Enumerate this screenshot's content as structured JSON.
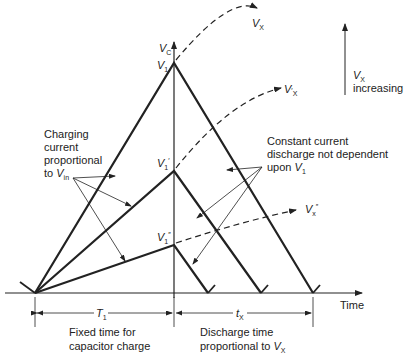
{
  "diagram": {
    "axes": {
      "y_label": "V",
      "y_label_sub": "C",
      "x_label": "Time"
    },
    "peaks": [
      {
        "label": "V",
        "sub": "1",
        "prime": ""
      },
      {
        "label": "V",
        "sub": "1",
        "prime": "′"
      },
      {
        "label": "V",
        "sub": "1",
        "prime": "″"
      }
    ],
    "curves": [
      {
        "label": "V",
        "sub": "X",
        "prime": ""
      },
      {
        "label": "V",
        "sub": "X",
        "prime": "′"
      },
      {
        "label": "V",
        "sub": "x",
        "prime": "″"
      }
    ],
    "increasing_note": {
      "line1_v": "V",
      "line1_sub": "X",
      "line2": "increasing"
    },
    "charging_note": {
      "lines": [
        "Charging",
        "current",
        "proportional"
      ],
      "last_prefix": "to ",
      "last_v": "V",
      "last_sub": "in"
    },
    "discharge_note": {
      "lines": [
        "Constant current",
        "discharge not dependent"
      ],
      "last_prefix": "upon ",
      "last_v": "V",
      "last_sub": "1"
    },
    "intervals": {
      "t1": {
        "label": "T",
        "sub": "1",
        "caption": [
          "Fixed time for",
          "capacitor charge"
        ]
      },
      "tx": {
        "label": "t",
        "sub": "X",
        "caption_line1": "Discharge time",
        "caption_prefix": "proportional to ",
        "caption_v": "V",
        "caption_sub": "X"
      }
    },
    "colors": {
      "line": "#222222",
      "background": "#ffffff"
    }
  }
}
